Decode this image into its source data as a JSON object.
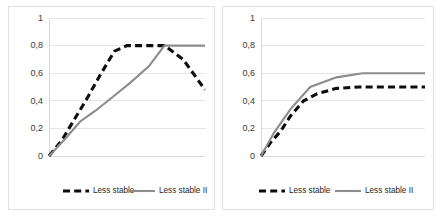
{
  "figure": {
    "panels": [
      "left",
      "right"
    ],
    "background_color": "#ffffff",
    "border_color": "#e2e2e2"
  },
  "colors": {
    "series_less_stable": "#0d0d0d",
    "series_less_stable_ii": "#8c8c8c",
    "gridline": "#e6e6e6",
    "tick_text": "#3a3a3a"
  },
  "legend": {
    "series_1_label": "Less stable",
    "series_2_label": "Less stable II"
  },
  "axis": {
    "yticks": [
      "1",
      "0,8",
      "0,6",
      "0,4",
      "0,2",
      "0"
    ],
    "ytick_values": [
      1,
      0.8,
      0.6,
      0.4,
      0.2,
      0
    ]
  },
  "chart_data": [
    {
      "id": "left",
      "type": "line",
      "title": "",
      "xlabel": "",
      "ylabel": "",
      "ylim": [
        0,
        1
      ],
      "xlim": [
        0,
        1
      ],
      "grid": true,
      "legend_position": "bottom",
      "yticks": [
        0,
        0.2,
        0.4,
        0.6,
        0.8,
        1
      ],
      "ytick_labels": [
        "0",
        "0,2",
        "0,4",
        "0,6",
        "0,8",
        "1"
      ],
      "series": [
        {
          "name": "Less stable",
          "style": "dashed",
          "color": "#0d0d0d",
          "x": [
            0.0,
            0.08,
            0.16,
            0.24,
            0.33,
            0.42,
            0.5,
            0.62,
            0.74,
            0.86,
            1.0
          ],
          "values": [
            0.0,
            0.11,
            0.26,
            0.41,
            0.59,
            0.76,
            0.8,
            0.8,
            0.8,
            0.7,
            0.48
          ]
        },
        {
          "name": "Less stable II",
          "style": "solid",
          "color": "#8c8c8c",
          "x": [
            0.0,
            0.1,
            0.2,
            0.3,
            0.4,
            0.52,
            0.64,
            0.74,
            0.86,
            1.0
          ],
          "values": [
            0.0,
            0.12,
            0.25,
            0.33,
            0.42,
            0.53,
            0.65,
            0.8,
            0.8,
            0.8
          ]
        }
      ]
    },
    {
      "id": "right",
      "type": "line",
      "title": "",
      "xlabel": "",
      "ylabel": "",
      "ylim": [
        0,
        1
      ],
      "xlim": [
        0,
        1
      ],
      "grid": true,
      "legend_position": "bottom",
      "yticks": [
        0,
        0.2,
        0.4,
        0.6,
        0.8,
        1
      ],
      "ytick_labels": [
        "0",
        "0,2",
        "0,4",
        "0,6",
        "0,8",
        "1"
      ],
      "series": [
        {
          "name": "Less stable",
          "style": "dashed",
          "color": "#0d0d0d",
          "x": [
            0.0,
            0.06,
            0.12,
            0.18,
            0.26,
            0.34,
            0.46,
            0.6,
            0.78,
            1.0
          ],
          "values": [
            0.0,
            0.1,
            0.18,
            0.29,
            0.4,
            0.45,
            0.49,
            0.5,
            0.5,
            0.5
          ]
        },
        {
          "name": "Less stable II",
          "style": "solid",
          "color": "#8c8c8c",
          "x": [
            0.0,
            0.08,
            0.18,
            0.3,
            0.46,
            0.62,
            0.8,
            1.0
          ],
          "values": [
            0.0,
            0.17,
            0.34,
            0.5,
            0.57,
            0.6,
            0.6,
            0.6
          ]
        }
      ]
    }
  ]
}
